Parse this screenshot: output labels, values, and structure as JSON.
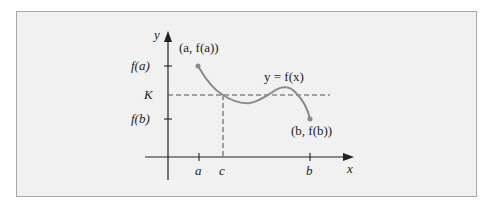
{
  "figure": {
    "axis_labels": {
      "x": "x",
      "y": "y"
    },
    "y_ticks": [
      {
        "label": "f(a)",
        "y": 66
      },
      {
        "label": "K",
        "y": 95
      },
      {
        "label": "f(b)",
        "y": 119
      }
    ],
    "x_ticks": [
      {
        "label": "a",
        "x": 199
      },
      {
        "label": "c",
        "x": 223
      },
      {
        "label": "b",
        "x": 310
      }
    ],
    "point_labels": {
      "start": "(a, f(a))",
      "end": "(b, f(b))"
    },
    "curve_label": "y = f(x)",
    "colors": {
      "curve": "#8a8a8a",
      "axes": "#222222",
      "dashed": "#555555",
      "background": "#f1f1f1",
      "border": "#a8a8a8"
    }
  }
}
